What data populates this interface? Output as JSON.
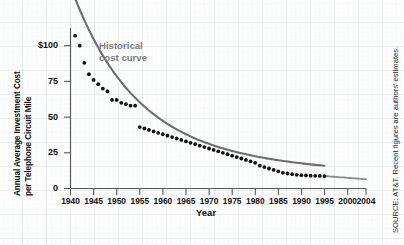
{
  "chart_data": {
    "type": "scatter",
    "title": "",
    "xlabel": "Year",
    "ylabel_line1": "Annual Average Investment Cost",
    "ylabel_line2": "per Telephone Circuit Mile",
    "xlim": [
      1940,
      2004
    ],
    "ylim": [
      0,
      112
    ],
    "xticks": [
      1940,
      1945,
      1950,
      1955,
      1960,
      1965,
      1970,
      1975,
      1980,
      1985,
      1990,
      1995,
      2000,
      2004
    ],
    "yticks": [
      0,
      25,
      50,
      75,
      100
    ],
    "ytick_labels": [
      "0",
      "25",
      "50",
      "75",
      "$100"
    ],
    "grid": true,
    "legend": "none",
    "annotation": "Historical\ncost curve",
    "annotation_line1": "Historical",
    "annotation_line2": "cost curve",
    "source_note": "SOURCE: AT&T. Recent figures are authors' estimates.",
    "marker_color": "#111111",
    "curve_color": "#6e6e6e",
    "annotation_color": "#7d7d7d",
    "axis_color": "#5a5a5a",
    "grid_color": "#c4ced6",
    "series": [
      {
        "name": "Annual average investment cost per telephone circuit mile",
        "x": [
          1941,
          1942,
          1943,
          1944,
          1945,
          1946,
          1947,
          1948,
          1949,
          1950,
          1951,
          1952,
          1953,
          1954,
          1955,
          1956,
          1957,
          1958,
          1959,
          1960,
          1961,
          1962,
          1963,
          1964,
          1965,
          1966,
          1967,
          1968,
          1969,
          1970,
          1971,
          1972,
          1973,
          1974,
          1975,
          1976,
          1977,
          1978,
          1979,
          1980,
          1981,
          1982,
          1983,
          1984,
          1985,
          1986,
          1987,
          1988,
          1989,
          1990,
          1991,
          1992,
          1993,
          1994,
          1995
        ],
        "y": [
          107,
          100,
          88,
          80,
          76,
          73,
          70,
          68,
          62,
          62,
          60,
          59,
          58,
          58,
          43,
          42,
          41,
          40,
          39,
          38,
          37,
          36,
          35,
          34,
          33,
          32,
          31,
          30,
          29,
          28,
          27,
          26,
          25,
          24,
          23,
          22,
          21,
          20,
          19,
          18,
          16,
          15,
          14,
          13,
          12,
          11,
          10.5,
          10,
          9.6,
          9.3,
          9.1,
          9,
          8.9,
          8.8,
          8.7
        ]
      }
    ],
    "fitted_curve_note": "smooth declining historical cost curve extended in gray from 1995 to 2004",
    "extension": {
      "x_start": 1995,
      "x_end": 2004,
      "y_start": 8.7,
      "y_end": 6.5
    }
  }
}
